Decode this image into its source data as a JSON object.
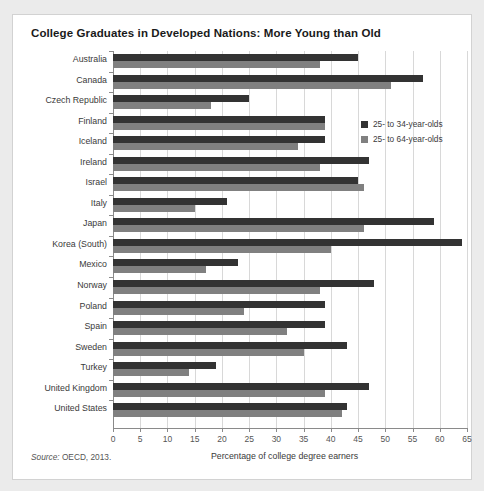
{
  "chart_title": "College Graduates in Developed Nations: More Young than Old",
  "source_prefix": "Source:",
  "source_text": " OECD, 2013.",
  "legend": {
    "position": "inside-right-top",
    "items": [
      {
        "label": "25- to 34-year-olds",
        "color": "#333333"
      },
      {
        "label": "25- to 64-year-olds",
        "color": "#808080"
      }
    ]
  },
  "chart_data": {
    "type": "bar",
    "orientation": "horizontal",
    "title": "College Graduates in Developed Nations: More Young than Old",
    "xlabel": "Percentage of college degree earners",
    "ylabel": "",
    "xlim": [
      0,
      65
    ],
    "xticks": [
      0,
      5,
      10,
      15,
      20,
      25,
      30,
      35,
      40,
      45,
      50,
      55,
      60,
      65
    ],
    "xtick_labels": [
      "0",
      "5",
      "10",
      "15",
      "20",
      "25",
      "30",
      "35",
      "40",
      "45",
      "50",
      "55",
      "60",
      "65"
    ],
    "grid": "vertical",
    "categories": [
      "Australia",
      "Canada",
      "Czech Republic",
      "Finland",
      "Iceland",
      "Ireland",
      "Israel",
      "Italy",
      "Japan",
      "Korea (South)",
      "Mexico",
      "Norway",
      "Poland",
      "Spain",
      "Sweden",
      "Turkey",
      "United Kingdom",
      "United States"
    ],
    "series": [
      {
        "name": "25- to 34-year-olds",
        "color": "#333333",
        "values": [
          45,
          57,
          25,
          39,
          39,
          47,
          45,
          21,
          59,
          64,
          23,
          48,
          39,
          39,
          43,
          19,
          47,
          43
        ]
      },
      {
        "name": "25- to 64-year-olds",
        "color": "#808080",
        "values": [
          38,
          51,
          18,
          39,
          34,
          38,
          46,
          15,
          46,
          40,
          17,
          38,
          24,
          32,
          35,
          14,
          39,
          42
        ]
      }
    ]
  }
}
